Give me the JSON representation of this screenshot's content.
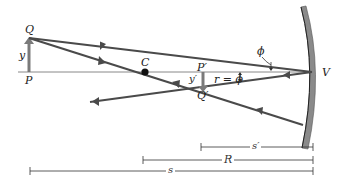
{
  "diagram": {
    "colors": {
      "ray": "#4a4a4a",
      "axis": "#777777",
      "mirror_fill": "#8a8a8a",
      "mirror_edge": "#333333",
      "object_arrow": "#777777",
      "point": "#111111"
    },
    "labels": {
      "Q": "Q",
      "P": "P",
      "y": "y",
      "C": "C",
      "P_prime": "P′",
      "Q_prime": "Q′",
      "y_prime": "y′",
      "phi": "ϕ",
      "r_eq_phi": "r = ϕ",
      "V": "V"
    },
    "dimensions": [
      {
        "name": "s_prime",
        "label": "s′"
      },
      {
        "name": "R",
        "label": "R"
      },
      {
        "name": "s",
        "label": "s"
      }
    ]
  }
}
